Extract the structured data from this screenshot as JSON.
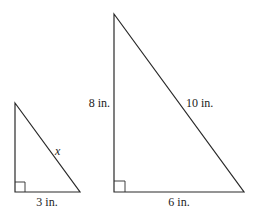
{
  "diagram": {
    "type": "similar-right-triangles",
    "stroke_color": "#2a2a2a",
    "label_color": "#222222",
    "triangles": [
      {
        "id": "small",
        "vertices": {
          "top": [
            15,
            103
          ],
          "right_angle": [
            15,
            192
          ],
          "right": [
            80,
            192
          ]
        },
        "right_angle_marker": true,
        "labels": {
          "base": "3 in.",
          "hypotenuse": "x"
        }
      },
      {
        "id": "large",
        "vertices": {
          "top": [
            114,
            14
          ],
          "right_angle": [
            114,
            192
          ],
          "right": [
            244,
            192
          ]
        },
        "right_angle_marker": true,
        "labels": {
          "height": "8 in.",
          "hypotenuse": "10 in.",
          "base": "6 in."
        }
      }
    ]
  }
}
